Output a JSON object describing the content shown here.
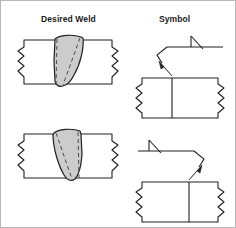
{
  "figure": {
    "title_columns": {
      "desired_weld": "Desired Weld",
      "symbol": "Symbol"
    },
    "background_color": "#ffffff",
    "line_color": "#231f20",
    "weld_fill_color": "#cccccc",
    "border_color": "#b8b8b8"
  },
  "rows": [
    {
      "id": "row-1",
      "desired_weld": {
        "joint_type": "butt-joint-two-plates",
        "weld_type": "bevel-groove-weld",
        "bevel_direction": "right-leaning",
        "has_reinforcement_crown": "true",
        "has_root_reinforcement": "true",
        "dashed_fusion_lines": "2"
      },
      "symbol": {
        "weld_symbol_name": "bevel-groove",
        "symbol_side": "above-reference-line",
        "arrow_side": "arrow-side-member",
        "leader_break_direction": "left",
        "arrow_points": "down-left",
        "arrow_target": "left-member-of-joint"
      }
    },
    {
      "id": "row-2",
      "desired_weld": {
        "joint_type": "butt-joint-two-plates",
        "weld_type": "bevel-groove-weld",
        "bevel_direction": "left-leaning",
        "has_reinforcement_crown": "true",
        "has_root_reinforcement": "true",
        "dashed_fusion_lines": "2"
      },
      "symbol": {
        "weld_symbol_name": "bevel-groove",
        "symbol_side": "above-reference-line",
        "arrow_side": "arrow-side-member",
        "leader_break_direction": "right",
        "arrow_points": "down-right",
        "arrow_target": "right-member-of-joint"
      }
    }
  ]
}
